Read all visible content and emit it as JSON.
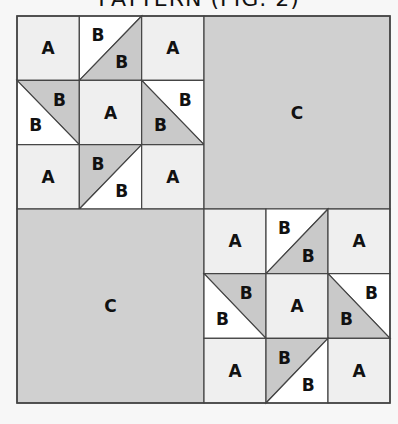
{
  "title": "PATTERN (FIG. 2)",
  "colors": {
    "background": "#f7f7f7",
    "a_fill": "#efefef",
    "b_light": "#ffffff",
    "b_dark": "#c9c9c9",
    "c_fill": "#d0d0d0",
    "line": "#444444"
  },
  "labels": {
    "a": "A",
    "b": "B",
    "c": "C"
  },
  "layout": {
    "outer": {
      "x": 17,
      "y": 16,
      "w": 373,
      "h": 387
    },
    "split": {
      "x": 204,
      "y": 209
    }
  },
  "blocks": [
    {
      "position": "top-left",
      "type": "star",
      "x": 17,
      "y": 16,
      "w": 187,
      "h": 193
    },
    {
      "position": "top-right",
      "type": "plain",
      "label": "C",
      "x": 204,
      "y": 16,
      "w": 186,
      "h": 193
    },
    {
      "position": "bottom-left",
      "type": "plain",
      "label": "C",
      "x": 17,
      "y": 209,
      "w": 187,
      "h": 194
    },
    {
      "position": "bottom-right",
      "type": "star",
      "x": 204,
      "y": 209,
      "w": 186,
      "h": 194
    }
  ],
  "star_cells": [
    [
      "A",
      "B/B top",
      "A"
    ],
    [
      "B/B left",
      "A",
      "B/B right"
    ],
    [
      "A",
      "B/B bottom",
      "A"
    ]
  ]
}
